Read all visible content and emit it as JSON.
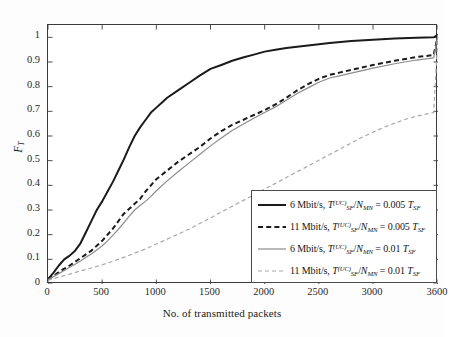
{
  "chart_data": {
    "type": "line",
    "title": "",
    "xlabel": "No. of transmitted packets",
    "ylabel": "F_T",
    "ylabel_base": "F",
    "ylabel_sub": "T",
    "xlim": [
      0,
      3600
    ],
    "ylim": [
      0,
      1.05
    ],
    "grid": false,
    "legend_position": "lower right",
    "xticks": [
      0,
      500,
      1000,
      1500,
      2000,
      2500,
      3000,
      3600
    ],
    "xticklabels": [
      "0",
      "500",
      "1000",
      "1500",
      "2000",
      "2500",
      "3000",
      "3600"
    ],
    "yticks": [
      0,
      0.1,
      0.2,
      0.3,
      0.4,
      0.5,
      0.6,
      0.7,
      0.8,
      0.9,
      1
    ],
    "yticklabels": [
      "0",
      "0.1",
      "0.2",
      "0.3",
      "0.4",
      "0.5",
      "0.6",
      "0.7",
      "0.8",
      "0.9",
      "1"
    ],
    "series": [
      {
        "name": "6 Mbit/s, T_SF^(UC)/N_MN = 0.005 T_SF",
        "rate": "6 Mbit/s",
        "ratio": "0.005",
        "color": "#1b1b1b",
        "style": "solid",
        "width": 2.0,
        "x": [
          0,
          50,
          100,
          150,
          200,
          250,
          300,
          350,
          400,
          450,
          500,
          550,
          600,
          650,
          700,
          750,
          800,
          850,
          900,
          950,
          1000,
          1050,
          1100,
          1200,
          1300,
          1400,
          1500,
          1600,
          1700,
          1800,
          1900,
          2000,
          2100,
          2200,
          2300,
          2400,
          2500,
          2600,
          2800,
          3000,
          3200,
          3400,
          3560,
          3600
        ],
        "y": [
          0.02,
          0.045,
          0.075,
          0.1,
          0.115,
          0.135,
          0.165,
          0.21,
          0.255,
          0.3,
          0.335,
          0.375,
          0.415,
          0.46,
          0.505,
          0.555,
          0.6,
          0.635,
          0.665,
          0.695,
          0.715,
          0.735,
          0.755,
          0.785,
          0.815,
          0.845,
          0.872,
          0.888,
          0.905,
          0.918,
          0.93,
          0.942,
          0.95,
          0.957,
          0.962,
          0.967,
          0.972,
          0.977,
          0.985,
          0.99,
          0.995,
          0.998,
          1.0,
          1.01
        ]
      },
      {
        "name": "11 Mbit/s, T_SF^(UC)/N_MN = 0.005 T_SF",
        "rate": "11 Mbit/s",
        "ratio": "0.005",
        "color": "#1b1b1b",
        "style": "dashed",
        "width": 2.0,
        "x": [
          0,
          50,
          100,
          150,
          200,
          250,
          300,
          350,
          400,
          450,
          500,
          550,
          600,
          650,
          700,
          750,
          800,
          850,
          900,
          950,
          1000,
          1100,
          1200,
          1300,
          1400,
          1500,
          1600,
          1700,
          1800,
          1900,
          2000,
          2100,
          2200,
          2300,
          2400,
          2500,
          2600,
          2700,
          2800,
          3000,
          3200,
          3400,
          3560,
          3600
        ],
        "y": [
          0.018,
          0.032,
          0.048,
          0.062,
          0.075,
          0.09,
          0.105,
          0.12,
          0.135,
          0.155,
          0.175,
          0.2,
          0.225,
          0.255,
          0.285,
          0.305,
          0.325,
          0.345,
          0.375,
          0.4,
          0.425,
          0.46,
          0.495,
          0.525,
          0.555,
          0.59,
          0.62,
          0.645,
          0.665,
          0.685,
          0.705,
          0.728,
          0.755,
          0.785,
          0.81,
          0.832,
          0.848,
          0.858,
          0.868,
          0.888,
          0.905,
          0.92,
          0.928,
          1.01
        ]
      },
      {
        "name": "6 Mbit/s, T_SF^(UC)/N_MN = 0.01 T_SF",
        "rate": "6 Mbit/s",
        "ratio": "0.01",
        "color": "#8c8c8c",
        "style": "solid",
        "width": 1.2,
        "x": [
          0,
          50,
          100,
          150,
          200,
          250,
          300,
          350,
          400,
          450,
          500,
          550,
          600,
          650,
          700,
          750,
          800,
          850,
          900,
          950,
          1000,
          1100,
          1200,
          1300,
          1400,
          1500,
          1600,
          1700,
          1800,
          1900,
          2000,
          2100,
          2200,
          2300,
          2400,
          2500,
          2600,
          2700,
          2800,
          3000,
          3200,
          3400,
          3560,
          3600
        ],
        "y": [
          0.018,
          0.03,
          0.042,
          0.055,
          0.068,
          0.08,
          0.093,
          0.108,
          0.122,
          0.138,
          0.155,
          0.175,
          0.198,
          0.222,
          0.248,
          0.275,
          0.3,
          0.318,
          0.335,
          0.355,
          0.378,
          0.418,
          0.455,
          0.49,
          0.525,
          0.56,
          0.592,
          0.622,
          0.648,
          0.672,
          0.695,
          0.718,
          0.745,
          0.772,
          0.795,
          0.818,
          0.835,
          0.845,
          0.855,
          0.875,
          0.893,
          0.908,
          0.917,
          1.01
        ]
      },
      {
        "name": "11 Mbit/s, T_SF^(UC)/N_MN = 0.01 T_SF",
        "rate": "11 Mbit/s",
        "ratio": "0.01",
        "color": "#a8a8a8",
        "style": "dashed",
        "width": 1.2,
        "x": [
          0,
          100,
          200,
          300,
          400,
          500,
          600,
          700,
          800,
          900,
          1000,
          1100,
          1200,
          1300,
          1400,
          1500,
          1600,
          1700,
          1800,
          1900,
          2000,
          2100,
          2200,
          2300,
          2400,
          2500,
          2600,
          2700,
          2800,
          2900,
          3000,
          3100,
          3200,
          3300,
          3400,
          3500,
          3560,
          3600
        ],
        "y": [
          0.015,
          0.028,
          0.04,
          0.053,
          0.065,
          0.078,
          0.092,
          0.108,
          0.125,
          0.142,
          0.162,
          0.182,
          0.202,
          0.222,
          0.245,
          0.268,
          0.292,
          0.315,
          0.338,
          0.362,
          0.385,
          0.408,
          0.432,
          0.455,
          0.478,
          0.502,
          0.525,
          0.548,
          0.572,
          0.595,
          0.615,
          0.635,
          0.652,
          0.668,
          0.68,
          0.69,
          0.695,
          1.01
        ]
      }
    ]
  },
  "legend": {
    "entries": [
      {
        "rate": "6 Mbit/s,",
        "num": "T",
        "num_sub": "SF",
        "num_sup": "(UC)",
        "den": "N",
        "den_sub": "MN",
        "eq": "= 0.005",
        "tail": "T",
        "tail_sub": "SF",
        "slash": "/",
        "style": "solid",
        "color": "#1b1b1b",
        "width": "2.0"
      },
      {
        "rate": "11 Mbit/s,",
        "num": "T",
        "num_sub": "SF",
        "num_sup": "(UC)",
        "den": "N",
        "den_sub": "MN",
        "eq": "= 0.005",
        "tail": "T",
        "tail_sub": "SF",
        "slash": "/",
        "style": "dashed",
        "color": "#1b1b1b",
        "width": "2.0"
      },
      {
        "rate": "6 Mbit/s,",
        "num": "T",
        "num_sub": "SF",
        "num_sup": "(UC)",
        "den": "N",
        "den_sub": "MN",
        "eq": "= 0.01",
        "tail": "T",
        "tail_sub": "SF",
        "slash": "/",
        "style": "solid",
        "color": "#8c8c8c",
        "width": "1.2"
      },
      {
        "rate": "11 Mbit/s,",
        "num": "T",
        "num_sub": "SF",
        "num_sup": "(UC)",
        "den": "N",
        "den_sub": "MN",
        "eq": "= 0.01",
        "tail": "T",
        "tail_sub": "SF",
        "slash": "/",
        "style": "dashed",
        "color": "#a8a8a8",
        "width": "1.2"
      }
    ]
  },
  "colors": {
    "axis": "#3b3b3b",
    "background": "#ffffff",
    "text": "#1a1a1a"
  }
}
